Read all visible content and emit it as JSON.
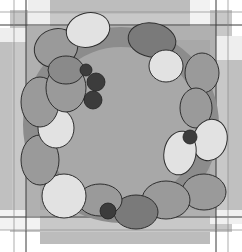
{
  "colors": {
    "background": "#ffffff",
    "outer_frame": "#d0d0d0",
    "panel": "#b0b0b0",
    "inner_panel": "#a8a8a8",
    "line": "#3a3a3a",
    "leaf_light": "#e2e2e2",
    "leaf_mid": "#9a9a9a",
    "leaf_dark": "#7a7a7a",
    "berry": "#3c3c3c"
  }
}
